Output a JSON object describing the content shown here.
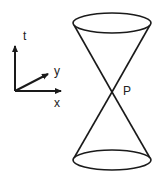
{
  "diagram": {
    "axes": {
      "t_label": "t",
      "x_label": "x",
      "y_label": "y"
    },
    "cone": {
      "vertex_label": "P"
    },
    "colors": {
      "stroke": "#1a1a1a",
      "background": "#ffffff"
    }
  }
}
